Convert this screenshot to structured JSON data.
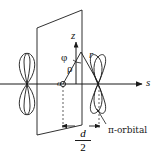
{
  "figure": {
    "type": "physics-diagram",
    "colors": {
      "stroke": "#1a1a1a",
      "background": "#ffffff"
    },
    "labels": {
      "z_axis": "z",
      "s_axis": "s",
      "angle_phi": "φ",
      "radial_rho": "ρ",
      "radial_r": "r",
      "origin": "o",
      "orbital": "π-orbital",
      "distance_numerator": "d",
      "distance_denominator": "2"
    },
    "elements": {
      "plane": "vertical-parallelogram-plane",
      "left_orbital": "p-orbital-vertical-figure-eight",
      "right_orbital": "pi-orbital-tilted-figure-eight",
      "dimension": "d-over-2-span"
    }
  }
}
